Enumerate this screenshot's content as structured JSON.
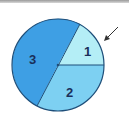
{
  "diagram": {
    "type": "pie-circle",
    "segments": [
      {
        "label": "1",
        "color": "#b4eef6"
      },
      {
        "label": "2",
        "color": "#7dd0f2"
      },
      {
        "label": "3",
        "color": "#3e9fe4"
      }
    ],
    "outline_color": "#1f4f7a",
    "arrow_color": "#333333"
  }
}
